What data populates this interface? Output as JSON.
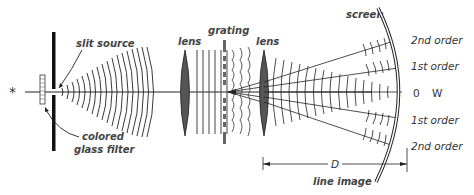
{
  "diagram": {
    "labels": {
      "source_symbol": "*",
      "slit_source": "slit source",
      "filter": "colored",
      "filter_line2": "glass filter",
      "lens1": "lens",
      "grating": "grating",
      "lens2": "lens",
      "screen": "screen",
      "distance": "D",
      "line_image": "line image"
    },
    "orders": [
      {
        "label": "2nd order"
      },
      {
        "label": "1st order"
      },
      {
        "label": "0",
        "extra": "W"
      },
      {
        "label": "1st order"
      },
      {
        "label": "2nd order"
      }
    ],
    "colors": {
      "ink": "#222222",
      "lens_fill": "#555555",
      "background": "#ffffff"
    }
  }
}
